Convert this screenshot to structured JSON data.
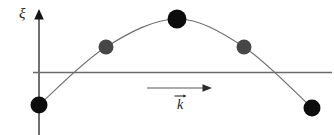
{
  "figure": {
    "title": "",
    "background_color": "#ffffff",
    "width": 334,
    "height": 135,
    "axis": {
      "vertical_axis_label": "ξ",
      "vertical_axis_color": "#4d4d4d",
      "vertical_axis_x": 39,
      "vertical_axis_top": 10,
      "vertical_axis_bottom": 135,
      "horizontal_line_color": "#6b6b6b",
      "horizontal_line_y": 72,
      "horizontal_line_x_start": 33,
      "horizontal_line_x_end": 332
    },
    "wave": {
      "curve_color": "#6e6e6e",
      "curve_stroke_width": 1.1,
      "description": "transverse displacement wave arc"
    },
    "k_vector": {
      "label": "k",
      "arrow_label_overline": "→",
      "arrow_color": "#5a5a5a",
      "arrow_x_start": 147,
      "arrow_x_end": 212,
      "arrow_y": 88
    },
    "particles": [
      {
        "id": "particle-1",
        "cx": 39,
        "cy": 105,
        "r": 8.5,
        "color": "#0d0d0d",
        "tone": "black"
      },
      {
        "id": "particle-2",
        "cx": 106,
        "cy": 47,
        "r": 7.5,
        "color": "#474747",
        "tone": "gray"
      },
      {
        "id": "particle-3",
        "cx": 177,
        "cy": 19,
        "r": 9.5,
        "color": "#0d0d0d",
        "tone": "black"
      },
      {
        "id": "particle-4",
        "cx": 244,
        "cy": 47,
        "r": 7.5,
        "color": "#474747",
        "tone": "gray"
      },
      {
        "id": "particle-5",
        "cx": 312,
        "cy": 108,
        "r": 8.5,
        "color": "#0d0d0d",
        "tone": "black"
      }
    ]
  },
  "chart_data": {
    "type": "line",
    "title": "",
    "xlabel": "",
    "ylabel": "ξ",
    "x": [
      39,
      106,
      177,
      244,
      312
    ],
    "values": [
      105,
      47,
      19,
      47,
      108
    ],
    "series": [
      {
        "name": "wave displacement",
        "x": [
          39,
          106,
          177,
          244,
          312
        ],
        "values": [
          105,
          47,
          19,
          47,
          108
        ]
      }
    ],
    "point_labels": [
      "particle-1",
      "particle-2",
      "particle-3",
      "particle-4",
      "particle-5"
    ],
    "point_colors": [
      "#0d0d0d",
      "#474747",
      "#0d0d0d",
      "#474747",
      "#0d0d0d"
    ],
    "annotations": [
      "ξ",
      "k"
    ],
    "grid": false,
    "legend": "none",
    "baseline_y": 72,
    "xlim": [
      33,
      332
    ],
    "ylim": [
      10,
      135
    ]
  }
}
